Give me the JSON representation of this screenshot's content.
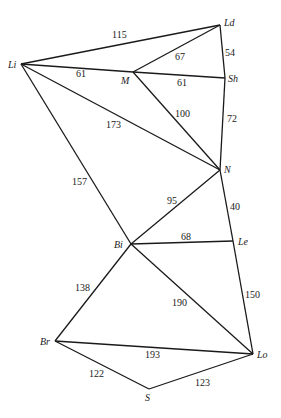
{
  "diagram": {
    "type": "weighted-undirected-graph",
    "nodes": [
      {
        "id": "Li",
        "label": "Li",
        "x": 21,
        "y": 64,
        "lx": 8,
        "ly": 68
      },
      {
        "id": "Ld",
        "label": "Ld",
        "x": 220,
        "y": 25,
        "lx": 224,
        "ly": 26
      },
      {
        "id": "M",
        "label": "M",
        "x": 133,
        "y": 72,
        "lx": 121,
        "ly": 84
      },
      {
        "id": "Sh",
        "label": "Sh",
        "x": 225,
        "y": 78,
        "lx": 228,
        "ly": 82
      },
      {
        "id": "N",
        "label": "N",
        "x": 220,
        "y": 170,
        "lx": 224,
        "ly": 173
      },
      {
        "id": "Bi",
        "label": "Bi",
        "x": 131,
        "y": 244,
        "lx": 114,
        "ly": 248
      },
      {
        "id": "Le",
        "label": "Le",
        "x": 233,
        "y": 241,
        "lx": 238,
        "ly": 245
      },
      {
        "id": "Br",
        "label": "Br",
        "x": 55,
        "y": 341,
        "lx": 40,
        "ly": 345
      },
      {
        "id": "Lo",
        "label": "Lo",
        "x": 253,
        "y": 354,
        "lx": 257,
        "ly": 358
      },
      {
        "id": "S",
        "label": "S",
        "x": 149,
        "y": 389,
        "lx": 145,
        "ly": 401
      }
    ],
    "edges": [
      {
        "from": "Li",
        "to": "Ld",
        "weight": "115",
        "lx": 112,
        "ly": 38
      },
      {
        "from": "Li",
        "to": "M",
        "weight": "61",
        "lx": 76,
        "ly": 77
      },
      {
        "from": "Li",
        "to": "N",
        "weight": "173",
        "lx": 106,
        "ly": 128
      },
      {
        "from": "Li",
        "to": "Bi",
        "weight": "157",
        "lx": 72,
        "ly": 185
      },
      {
        "from": "M",
        "to": "Ld",
        "weight": "67",
        "lx": 175,
        "ly": 60
      },
      {
        "from": "M",
        "to": "Sh",
        "weight": "61",
        "lx": 177,
        "ly": 86
      },
      {
        "from": "M",
        "to": "N",
        "weight": "100",
        "lx": 175,
        "ly": 117
      },
      {
        "from": "Ld",
        "to": "Sh",
        "weight": "54",
        "lx": 225,
        "ly": 56
      },
      {
        "from": "Sh",
        "to": "N",
        "weight": "72",
        "lx": 227,
        "ly": 122
      },
      {
        "from": "N",
        "to": "Bi",
        "weight": "95",
        "lx": 167,
        "ly": 204
      },
      {
        "from": "N",
        "to": "Le",
        "weight": "40",
        "lx": 230,
        "ly": 210
      },
      {
        "from": "Bi",
        "to": "Le",
        "weight": "68",
        "lx": 181,
        "ly": 240
      },
      {
        "from": "Bi",
        "to": "Br",
        "weight": "138",
        "lx": 75,
        "ly": 291
      },
      {
        "from": "Bi",
        "to": "Lo",
        "weight": "190",
        "lx": 172,
        "ly": 306
      },
      {
        "from": "Le",
        "to": "Lo",
        "weight": "150",
        "lx": 245,
        "ly": 298
      },
      {
        "from": "Br",
        "to": "Lo",
        "weight": "193",
        "lx": 145,
        "ly": 358
      },
      {
        "from": "Br",
        "to": "S",
        "weight": "122",
        "lx": 89,
        "ly": 377
      },
      {
        "from": "S",
        "to": "Lo",
        "weight": "123",
        "lx": 195,
        "ly": 386
      }
    ]
  }
}
